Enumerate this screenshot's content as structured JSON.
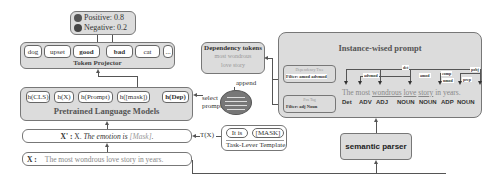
{
  "output": {
    "positive": "Positive: 0.8",
    "negative": "Negative: 0.2"
  },
  "token_projector": {
    "title": "Token Projector",
    "tokens": [
      "dog",
      "upset",
      "good",
      "bad",
      "cat",
      "..."
    ]
  },
  "plm": {
    "title": "Pretrained Language Models",
    "hidden": [
      "h(CLS)",
      "h(X)",
      "h(Prompt)",
      "h([mask])",
      "h(Dep)"
    ]
  },
  "select_prompt": "select\nprompt",
  "select_prompt_line1": "select",
  "select_prompt_line2": "prompt",
  "xprime": {
    "label": "X' :",
    "text_plain": " X. ",
    "text_italic": "The emotion is",
    "mask": " [Mask]",
    "end": "."
  },
  "tx": "T(X)",
  "x_input": {
    "label": "X :",
    "text": "The most wondrous love story in years."
  },
  "template": {
    "tokens": [
      "It is",
      "[MASK]"
    ],
    "title": "Task-Lever Template"
  },
  "dependency_tokens": {
    "title": "Dependency tokens",
    "line1": "most wondrous",
    "line2": "love story"
  },
  "append": "append",
  "instance_prompt": {
    "title": "Instance-wised prompt",
    "dep_filter": {
      "label": "Dependency Tree",
      "filter": "Filter: amod advmod"
    },
    "pos_filter": {
      "label": "Pos Tag",
      "filter": "Filter: adj Noun"
    },
    "dep_relations": [
      "det",
      "advmod",
      "amod",
      "comp",
      "nmod",
      "prep",
      "pobj"
    ],
    "sentence": [
      "The",
      "most",
      "wondrous",
      "love",
      "story",
      "in",
      "years."
    ],
    "pos_tags": [
      "Det",
      "ADV",
      "ADJ",
      "NOUN",
      "NOUN",
      "ADP",
      "NOUN"
    ]
  },
  "semantic_parser": "semantic parser"
}
